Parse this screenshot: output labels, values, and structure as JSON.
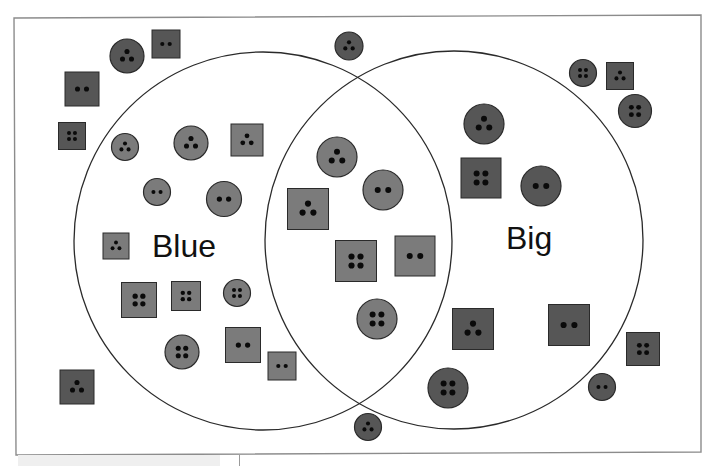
{
  "diagram": {
    "type": "venn",
    "colors": {
      "frame": "#8c8c8c",
      "circle_stroke": "#2a2a2a",
      "shape_dark": "#565656",
      "shape_light": "#7b7b7b",
      "shape_stroke": "#2a2a2a",
      "hole": "#0a0a0a"
    },
    "sets": [
      {
        "id": "blue",
        "label": "Blue",
        "cx": 263,
        "cy": 241,
        "r": 189,
        "label_x": 152,
        "label_y": 230
      },
      {
        "id": "big",
        "label": "Big",
        "cx": 454,
        "cy": 240,
        "r": 189,
        "label_x": 506,
        "label_y": 222
      }
    ],
    "items": [
      {
        "shape": "circle",
        "x": 127,
        "y": 56,
        "size": 34,
        "holes": 3,
        "region": "outside"
      },
      {
        "shape": "square",
        "x": 166,
        "y": 44,
        "size": 28,
        "holes": 2,
        "region": "outside"
      },
      {
        "shape": "square",
        "x": 82,
        "y": 89,
        "size": 34,
        "holes": 2,
        "region": "outside"
      },
      {
        "shape": "square",
        "x": 72,
        "y": 136,
        "size": 27,
        "holes": 4,
        "region": "outside"
      },
      {
        "shape": "circle",
        "x": 349,
        "y": 46,
        "size": 28,
        "holes": 3,
        "region": "outside"
      },
      {
        "shape": "circle",
        "x": 583,
        "y": 73,
        "size": 27,
        "holes": 4,
        "region": "outside"
      },
      {
        "shape": "square",
        "x": 620,
        "y": 76,
        "size": 27,
        "holes": 3,
        "region": "outside"
      },
      {
        "shape": "circle",
        "x": 635,
        "y": 111,
        "size": 33,
        "holes": 4,
        "region": "outside"
      },
      {
        "shape": "square",
        "x": 77,
        "y": 387,
        "size": 34,
        "holes": 3,
        "region": "outside"
      },
      {
        "shape": "circle",
        "x": 368,
        "y": 427,
        "size": 27,
        "holes": 3,
        "region": "outside"
      },
      {
        "shape": "circle",
        "x": 602,
        "y": 387,
        "size": 27,
        "holes": 2,
        "region": "outside"
      },
      {
        "shape": "square",
        "x": 643,
        "y": 349,
        "size": 33,
        "holes": 4,
        "region": "outside"
      },
      {
        "shape": "circle",
        "x": 125,
        "y": 147,
        "size": 27,
        "holes": 3,
        "region": "blue"
      },
      {
        "shape": "circle",
        "x": 191,
        "y": 143,
        "size": 34,
        "holes": 3,
        "region": "blue"
      },
      {
        "shape": "square",
        "x": 247,
        "y": 140,
        "size": 32,
        "holes": 3,
        "region": "blue"
      },
      {
        "shape": "circle",
        "x": 157,
        "y": 192,
        "size": 27,
        "holes": 2,
        "region": "blue"
      },
      {
        "shape": "circle",
        "x": 224,
        "y": 199,
        "size": 35,
        "holes": 2,
        "region": "blue"
      },
      {
        "shape": "square",
        "x": 116,
        "y": 246,
        "size": 26,
        "holes": 3,
        "region": "blue"
      },
      {
        "shape": "square",
        "x": 139,
        "y": 300,
        "size": 35,
        "holes": 4,
        "region": "blue"
      },
      {
        "shape": "square",
        "x": 186,
        "y": 296,
        "size": 29,
        "holes": 4,
        "region": "blue"
      },
      {
        "shape": "circle",
        "x": 237,
        "y": 293,
        "size": 27,
        "holes": 4,
        "region": "blue"
      },
      {
        "shape": "circle",
        "x": 182,
        "y": 352,
        "size": 34,
        "holes": 4,
        "region": "blue"
      },
      {
        "shape": "square",
        "x": 243,
        "y": 345,
        "size": 35,
        "holes": 2,
        "region": "blue"
      },
      {
        "shape": "square",
        "x": 282,
        "y": 366,
        "size": 28,
        "holes": 2,
        "region": "blue"
      },
      {
        "shape": "circle",
        "x": 337,
        "y": 157,
        "size": 40,
        "holes": 3,
        "region": "both"
      },
      {
        "shape": "circle",
        "x": 383,
        "y": 190,
        "size": 40,
        "holes": 2,
        "region": "both"
      },
      {
        "shape": "square",
        "x": 308,
        "y": 209,
        "size": 41,
        "holes": 3,
        "region": "both"
      },
      {
        "shape": "square",
        "x": 356,
        "y": 261,
        "size": 41,
        "holes": 4,
        "region": "both"
      },
      {
        "shape": "square",
        "x": 415,
        "y": 256,
        "size": 40,
        "holes": 2,
        "region": "both"
      },
      {
        "shape": "circle",
        "x": 377,
        "y": 319,
        "size": 40,
        "holes": 4,
        "region": "both"
      },
      {
        "shape": "circle",
        "x": 484,
        "y": 124,
        "size": 40,
        "holes": 3,
        "region": "big"
      },
      {
        "shape": "square",
        "x": 481,
        "y": 178,
        "size": 40,
        "holes": 4,
        "region": "big"
      },
      {
        "shape": "circle",
        "x": 541,
        "y": 186,
        "size": 40,
        "holes": 2,
        "region": "big"
      },
      {
        "shape": "square",
        "x": 473,
        "y": 329,
        "size": 41,
        "holes": 3,
        "region": "big"
      },
      {
        "shape": "square",
        "x": 569,
        "y": 325,
        "size": 41,
        "holes": 2,
        "region": "big"
      },
      {
        "shape": "circle",
        "x": 448,
        "y": 388,
        "size": 40,
        "holes": 4,
        "region": "big"
      }
    ]
  }
}
